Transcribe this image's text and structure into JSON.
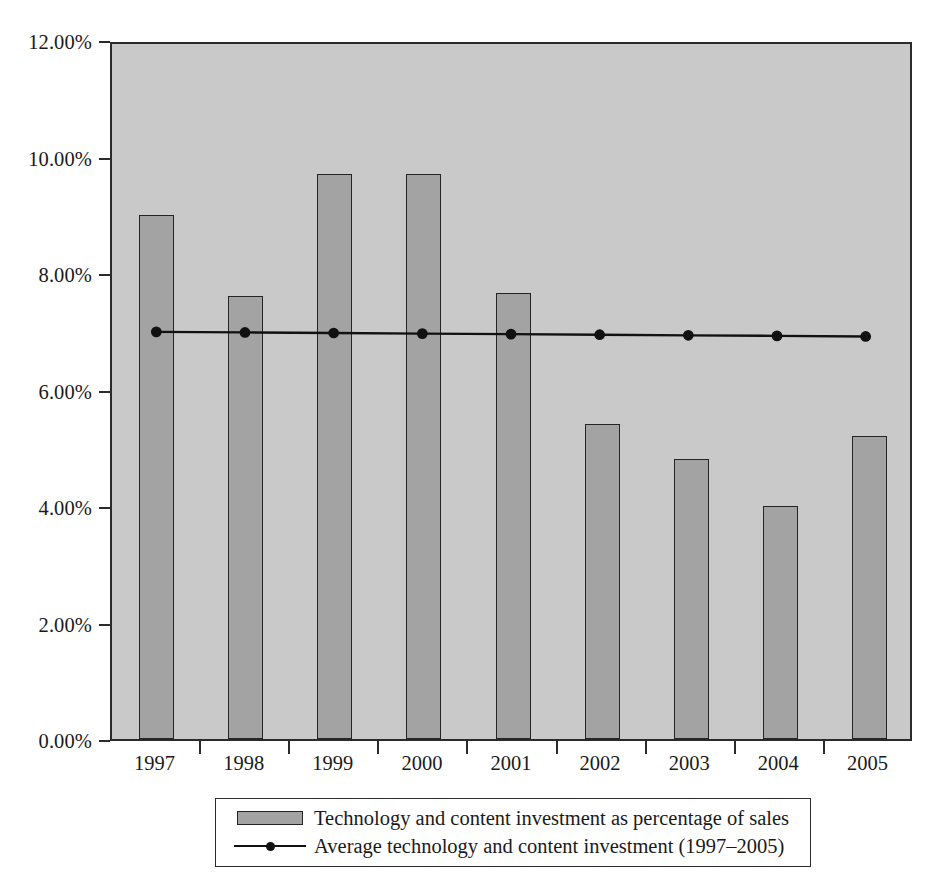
{
  "chart_data": {
    "type": "bar",
    "title": "",
    "subtitle": "",
    "xlabel": "",
    "ylabel": "",
    "categories": [
      "1997",
      "1998",
      "1999",
      "2000",
      "2001",
      "2002",
      "2003",
      "2004",
      "2005"
    ],
    "series": [
      {
        "name": "Technology and content investment as percentage of sales",
        "type": "bar",
        "values": [
          9.0,
          7.6,
          9.7,
          9.7,
          7.65,
          5.4,
          4.8,
          4.0,
          5.2
        ],
        "color": "#a3a3a3"
      },
      {
        "name": "Average technology and content investment (1997–2005)",
        "type": "line",
        "values": [
          7.03,
          7.02,
          7.01,
          7.0,
          6.99,
          6.98,
          6.97,
          6.96,
          6.95
        ],
        "color": "#111111"
      }
    ],
    "ylim": [
      0,
      12
    ],
    "ytick_values": [
      0,
      2,
      4,
      6,
      8,
      10,
      12
    ],
    "ytick_labels": [
      "0.00%",
      "2.00%",
      "4.00%",
      "6.00%",
      "8.00%",
      "10.00%",
      "12.00%"
    ],
    "grid": false,
    "legend_position": "bottom",
    "plot_background": "#c9c9c9",
    "axis_color": "#2b2b2b"
  },
  "legend": {
    "items": [
      {
        "key": "bar-swatch",
        "label": "Technology and content investment as percentage of sales"
      },
      {
        "key": "line-marker",
        "label": "Average technology and content investment (1997–2005)"
      }
    ]
  }
}
